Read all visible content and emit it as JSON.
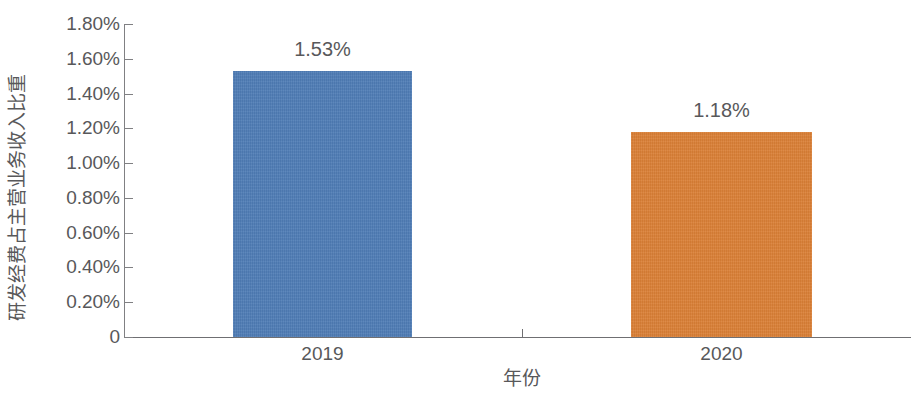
{
  "chart_data": {
    "type": "bar",
    "title": "",
    "categories": [
      "2019",
      "2020"
    ],
    "values": [
      1.53,
      1.18
    ],
    "value_labels": [
      "1.53%",
      "1.18%"
    ],
    "series": [
      {
        "name": "研发经费占主营业务收入比重",
        "values": [
          1.53,
          1.18
        ],
        "colors": [
          "#4e7cb5",
          "#da7f35"
        ]
      }
    ],
    "xlabel": "年份",
    "ylabel": "研发经费占主营业务收入比重",
    "ylim": [
      0,
      1.8
    ],
    "ytick_values": [
      1.8,
      1.6,
      1.4,
      1.2,
      1.0,
      0.8,
      0.6,
      0.4,
      0.2,
      0
    ],
    "ytick_labels": [
      "1.80%",
      "1.60%",
      "1.40%",
      "1.20%",
      "1.00%",
      "0.80%",
      "0.60%",
      "0.40%",
      "0.20%",
      "0"
    ],
    "grid": false,
    "legend": "none",
    "axis_color": "#808083",
    "text_color": "#58585a",
    "background": "#ffffff"
  },
  "axes": {
    "y_title": "研发经费占主营业务收入比重",
    "x_title": "年份",
    "y_ticks": [
      {
        "label": "1.80%",
        "value": 1.8
      },
      {
        "label": "1.60%",
        "value": 1.6
      },
      {
        "label": "1.40%",
        "value": 1.4
      },
      {
        "label": "1.20%",
        "value": 1.2
      },
      {
        "label": "1.00%",
        "value": 1.0
      },
      {
        "label": "0.80%",
        "value": 0.8
      },
      {
        "label": "0.60%",
        "value": 0.6
      },
      {
        "label": "0.40%",
        "value": 0.4
      },
      {
        "label": "0.20%",
        "value": 0.2
      },
      {
        "label": "0",
        "value": 0
      }
    ]
  },
  "bars": [
    {
      "category": "2019",
      "value": 1.53,
      "label": "1.53%",
      "color": "#4e7cb5"
    },
    {
      "category": "2020",
      "value": 1.18,
      "label": "1.18%",
      "color": "#da7f35"
    }
  ]
}
